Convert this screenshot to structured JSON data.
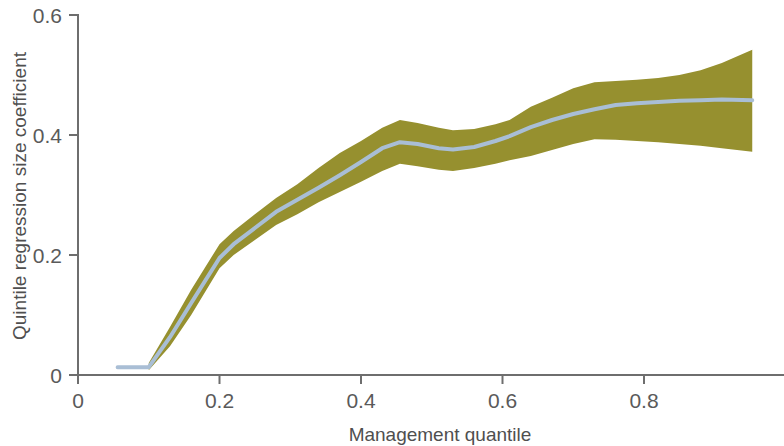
{
  "chart_data": {
    "type": "line",
    "title": "",
    "subtitle": "",
    "xlabel": "Management quantile",
    "ylabel": "Quintile regression size coefficient",
    "xlim": [
      0,
      0.98
    ],
    "ylim": [
      0,
      0.6
    ],
    "xticks": [
      0,
      0.2,
      0.4,
      0.6,
      0.8
    ],
    "xticklabels": [
      "0",
      "0.2",
      "0.4",
      "0.6",
      "0.8"
    ],
    "yticks": [
      0,
      0.2,
      0.4,
      0.6
    ],
    "yticklabels": [
      "0",
      "0.2",
      "0.4",
      "0.6"
    ],
    "grid": false,
    "legend": null,
    "annotations": [],
    "colors": {
      "line": "#a9bed5",
      "band": "#96902f",
      "axis": "#6e6e6e",
      "background": "#ffffff",
      "text": "#4f4f4f"
    },
    "series": [
      {
        "name": "Quintile regression size coefficient",
        "type": "line",
        "x": [
          0.056,
          0.1,
          0.13,
          0.16,
          0.2,
          0.22,
          0.25,
          0.28,
          0.31,
          0.34,
          0.37,
          0.4,
          0.43,
          0.455,
          0.48,
          0.51,
          0.53,
          0.56,
          0.59,
          0.61,
          0.64,
          0.67,
          0.7,
          0.73,
          0.76,
          0.79,
          0.82,
          0.85,
          0.88,
          0.91,
          0.953
        ],
        "values": [
          0.013,
          0.013,
          0.063,
          0.12,
          0.195,
          0.218,
          0.245,
          0.272,
          0.292,
          0.312,
          0.333,
          0.355,
          0.378,
          0.388,
          0.385,
          0.378,
          0.376,
          0.38,
          0.39,
          0.398,
          0.413,
          0.425,
          0.435,
          0.443,
          0.45,
          0.453,
          0.455,
          0.457,
          0.458,
          0.459,
          0.458
        ]
      },
      {
        "name": "Confidence band upper",
        "type": "band_upper",
        "x": [
          0.1,
          0.13,
          0.16,
          0.2,
          0.22,
          0.25,
          0.28,
          0.31,
          0.34,
          0.37,
          0.4,
          0.43,
          0.455,
          0.48,
          0.51,
          0.53,
          0.56,
          0.59,
          0.61,
          0.64,
          0.67,
          0.7,
          0.73,
          0.76,
          0.79,
          0.82,
          0.85,
          0.88,
          0.91,
          0.953
        ],
        "values": [
          0.02,
          0.08,
          0.142,
          0.218,
          0.24,
          0.268,
          0.295,
          0.318,
          0.345,
          0.37,
          0.39,
          0.412,
          0.425,
          0.42,
          0.412,
          0.408,
          0.41,
          0.418,
          0.425,
          0.447,
          0.462,
          0.478,
          0.488,
          0.49,
          0.492,
          0.495,
          0.5,
          0.508,
          0.52,
          0.542
        ]
      },
      {
        "name": "Confidence band lower",
        "type": "band_lower",
        "x": [
          0.1,
          0.13,
          0.16,
          0.2,
          0.22,
          0.25,
          0.28,
          0.31,
          0.34,
          0.37,
          0.4,
          0.43,
          0.455,
          0.48,
          0.51,
          0.53,
          0.56,
          0.59,
          0.61,
          0.64,
          0.67,
          0.7,
          0.73,
          0.76,
          0.79,
          0.82,
          0.85,
          0.88,
          0.91,
          0.953
        ],
        "values": [
          0.008,
          0.048,
          0.1,
          0.178,
          0.2,
          0.225,
          0.25,
          0.268,
          0.288,
          0.305,
          0.322,
          0.34,
          0.352,
          0.348,
          0.342,
          0.34,
          0.345,
          0.352,
          0.358,
          0.365,
          0.375,
          0.385,
          0.393,
          0.392,
          0.39,
          0.388,
          0.385,
          0.382,
          0.378,
          0.372
        ]
      }
    ]
  }
}
